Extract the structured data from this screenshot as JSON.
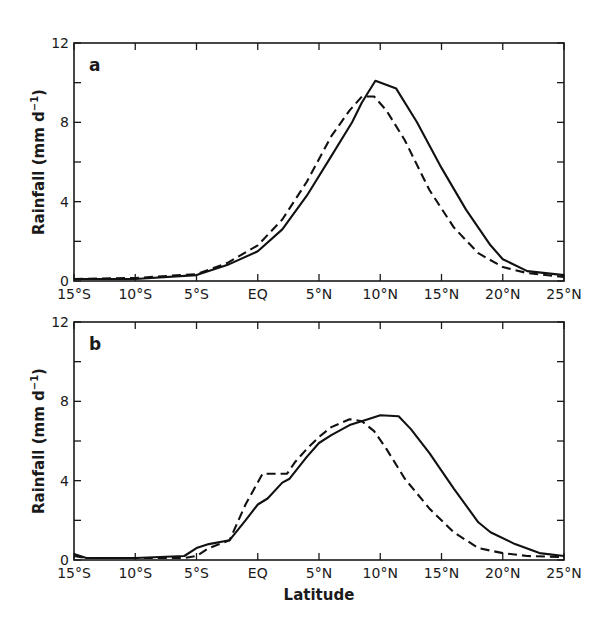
{
  "figure": {
    "xlabel": "Latitude",
    "ylabel": "Rainfall (mm d",
    "ylabel_sup": "−1",
    "ylabel_close": ")"
  },
  "chart_data": [
    {
      "type": "line",
      "panel": "a",
      "title": "",
      "xlabel": "",
      "ylabel": "Rainfall (mm d⁻¹)",
      "x_ticks": [
        "15°S",
        "10°S",
        "5°S",
        "EQ",
        "5°N",
        "10°N",
        "15°N",
        "20°N",
        "25°N"
      ],
      "x_tick_values": [
        -15,
        -10,
        -5,
        0,
        5,
        10,
        15,
        20,
        25
      ],
      "y_ticks": [
        0,
        4,
        8,
        12
      ],
      "y_minor_ticks": [
        2,
        6,
        10
      ],
      "xlim": [
        -15,
        25
      ],
      "ylim": [
        0,
        12
      ],
      "grid": false,
      "legend": null,
      "series": [
        {
          "name": "solid",
          "style": "solid",
          "x": [
            -15,
            -10,
            -5,
            -2.5,
            0,
            2,
            4,
            6,
            7.7,
            8.5,
            9.6,
            11.3,
            13,
            15,
            17,
            19,
            20,
            22,
            25
          ],
          "values": [
            0.1,
            0.1,
            0.3,
            0.8,
            1.5,
            2.6,
            4.3,
            6.3,
            8.0,
            9.0,
            10.1,
            9.7,
            8.0,
            5.7,
            3.6,
            1.8,
            1.1,
            0.5,
            0.3
          ]
        },
        {
          "name": "dashed",
          "style": "dashed",
          "x": [
            -15,
            -10,
            -5,
            -2.5,
            0,
            2,
            4,
            6,
            7.5,
            8.5,
            9.5,
            10.5,
            12,
            14,
            16,
            18,
            20,
            22,
            25
          ],
          "values": [
            0.1,
            0.15,
            0.35,
            0.9,
            1.8,
            3.1,
            5.0,
            7.3,
            8.6,
            9.3,
            9.3,
            8.6,
            7.1,
            4.6,
            2.7,
            1.4,
            0.7,
            0.4,
            0.2
          ]
        }
      ]
    },
    {
      "type": "line",
      "panel": "b",
      "title": "",
      "xlabel": "Latitude",
      "ylabel": "Rainfall (mm d⁻¹)",
      "x_ticks": [
        "15°S",
        "10°S",
        "5°S",
        "EQ",
        "5°N",
        "10°N",
        "15°N",
        "20°N",
        "25°N"
      ],
      "x_tick_values": [
        -15,
        -10,
        -5,
        0,
        5,
        10,
        15,
        20,
        25
      ],
      "y_ticks": [
        0,
        4,
        8,
        12
      ],
      "y_minor_ticks": [
        2,
        6,
        10
      ],
      "xlim": [
        -15,
        25
      ],
      "ylim": [
        0,
        12
      ],
      "grid": false,
      "legend": null,
      "series": [
        {
          "name": "solid",
          "style": "solid",
          "x": [
            -15,
            -14,
            -10,
            -6,
            -5,
            -4,
            -2.3,
            -1,
            0,
            0.8,
            2,
            2.6,
            4,
            5,
            6,
            7.5,
            9,
            10,
            11.5,
            12.5,
            14,
            16,
            18,
            19,
            21,
            23,
            25
          ],
          "values": [
            0.3,
            0.1,
            0.1,
            0.2,
            0.6,
            0.8,
            1.0,
            2.0,
            2.8,
            3.1,
            3.9,
            4.1,
            5.2,
            5.9,
            6.3,
            6.8,
            7.1,
            7.3,
            7.25,
            6.6,
            5.4,
            3.6,
            1.9,
            1.4,
            0.8,
            0.35,
            0.2
          ]
        },
        {
          "name": "dashed",
          "style": "dashed",
          "x": [
            -15,
            -14,
            -10,
            -6,
            -5,
            -4,
            -2.3,
            -1,
            0.4,
            1,
            2.4,
            3,
            4,
            5,
            6,
            7.5,
            8.5,
            9.5,
            10.5,
            12,
            14,
            16,
            18,
            20,
            22,
            25
          ],
          "values": [
            0.2,
            0.1,
            0.1,
            0.1,
            0.2,
            0.6,
            1.0,
            2.8,
            4.35,
            4.35,
            4.35,
            4.9,
            5.6,
            6.2,
            6.7,
            7.1,
            7.0,
            6.5,
            5.6,
            4.1,
            2.6,
            1.4,
            0.6,
            0.35,
            0.2,
            0.15
          ]
        }
      ]
    }
  ],
  "panels": [
    {
      "label": "a",
      "ylabel": "Rainfall (mm d",
      "ylabel_sup": "−1",
      "ylabel_close": ")"
    },
    {
      "label": "b",
      "ylabel": "Rainfall (mm d",
      "ylabel_sup": "−1",
      "ylabel_close": ")"
    }
  ]
}
